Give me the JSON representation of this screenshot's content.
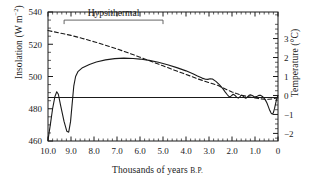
{
  "chart_data": {
    "type": "line",
    "title": "",
    "xlabel": "Thousands of years B.P.",
    "ylabel": "Insolation (W m−2)",
    "ylabel_right": "Temperature (°C)",
    "xlim": [
      10.0,
      0.0
    ],
    "ylim": [
      460,
      540
    ],
    "ylim_right": [
      -2.4,
      4.4
    ],
    "xticks": [
      "10.0",
      "9.0",
      "8.0",
      "7.0",
      "6.0",
      "5.0",
      "4.0",
      "3.0",
      "2.0",
      "1.0",
      "0"
    ],
    "xtick_values": [
      10.0,
      9.0,
      8.0,
      7.0,
      6.0,
      5.0,
      4.0,
      3.0,
      2.0,
      1.0,
      0.0
    ],
    "yticks_left": [
      "540",
      "520",
      "500",
      "480",
      "460"
    ],
    "ytick_values_left": [
      540,
      520,
      500,
      480,
      460
    ],
    "yticks_right": [
      "3",
      "2",
      "1",
      "0",
      "−1",
      "−2"
    ],
    "ytick_values_right": [
      3,
      2,
      1,
      0,
      -1,
      -2
    ],
    "grid": false,
    "minor_ticks": true,
    "legend_position": "none",
    "annotations": [
      {
        "name": "hypsithermal-label",
        "text": "Hypsithermal",
        "x_start": 9.3,
        "x_end": 5.0,
        "bracket_y_value": 535
      }
    ],
    "reference_line": {
      "name": "zero-temperature-line",
      "y_right_value": 0,
      "y_left_value": 487
    },
    "series": [
      {
        "name": "Insolation (dashed)",
        "style": "dashed",
        "axis": "left",
        "points": [
          [
            10.0,
            528.5
          ],
          [
            9.5,
            527.0
          ],
          [
            9.0,
            525.5
          ],
          [
            8.5,
            523.6
          ],
          [
            8.0,
            521.6
          ],
          [
            7.5,
            519.4
          ],
          [
            7.0,
            517.1
          ],
          [
            6.5,
            514.6
          ],
          [
            6.0,
            512.0
          ],
          [
            5.5,
            509.3
          ],
          [
            5.0,
            506.6
          ],
          [
            4.5,
            503.9
          ],
          [
            4.0,
            501.3
          ],
          [
            3.5,
            498.6
          ],
          [
            3.0,
            496.2
          ],
          [
            2.8,
            495.3
          ],
          [
            2.6,
            494.4
          ],
          [
            2.4,
            493.0
          ],
          [
            2.2,
            491.6
          ],
          [
            2.0,
            490.4
          ],
          [
            1.8,
            489.4
          ],
          [
            1.6,
            488.5
          ],
          [
            1.4,
            487.8
          ],
          [
            1.2,
            487.2
          ],
          [
            1.0,
            486.7
          ],
          [
            0.8,
            486.2
          ],
          [
            0.6,
            485.9
          ],
          [
            0.4,
            485.9
          ],
          [
            0.2,
            486.2
          ],
          [
            0.0,
            486.8
          ]
        ]
      },
      {
        "name": "Temperature (solid)",
        "style": "solid",
        "axis": "right",
        "points": [
          [
            10.0,
            460.5
          ],
          [
            9.9,
            470.0
          ],
          [
            9.8,
            480.0
          ],
          [
            9.7,
            487.5
          ],
          [
            9.62,
            490.5
          ],
          [
            9.55,
            489.0
          ],
          [
            9.45,
            482.0
          ],
          [
            9.3,
            472.0
          ],
          [
            9.18,
            466.0
          ],
          [
            9.1,
            465.5
          ],
          [
            9.02,
            472.0
          ],
          [
            8.95,
            483.0
          ],
          [
            8.88,
            494.0
          ],
          [
            8.8,
            500.0
          ],
          [
            8.7,
            503.0
          ],
          [
            8.5,
            505.5
          ],
          [
            8.2,
            507.5
          ],
          [
            7.9,
            509.0
          ],
          [
            7.5,
            510.3
          ],
          [
            7.1,
            511.1
          ],
          [
            6.7,
            511.4
          ],
          [
            6.3,
            511.2
          ],
          [
            6.0,
            510.8
          ],
          [
            5.6,
            510.0
          ],
          [
            5.2,
            508.8
          ],
          [
            4.8,
            507.3
          ],
          [
            4.4,
            505.5
          ],
          [
            4.0,
            503.5
          ],
          [
            3.7,
            501.7
          ],
          [
            3.5,
            500.3
          ],
          [
            3.3,
            499.0
          ],
          [
            3.15,
            498.3
          ],
          [
            3.05,
            498.2
          ],
          [
            2.95,
            498.6
          ],
          [
            2.85,
            498.4
          ],
          [
            2.7,
            497.0
          ],
          [
            2.55,
            495.0
          ],
          [
            2.4,
            492.5
          ],
          [
            2.3,
            490.5
          ],
          [
            2.22,
            489.0
          ],
          [
            2.15,
            487.8
          ],
          [
            2.1,
            487.3
          ],
          [
            2.03,
            488.0
          ],
          [
            1.95,
            489.0
          ],
          [
            1.88,
            488.4
          ],
          [
            1.8,
            487.2
          ],
          [
            1.73,
            486.6
          ],
          [
            1.66,
            487.4
          ],
          [
            1.6,
            488.4
          ],
          [
            1.53,
            488.0
          ],
          [
            1.46,
            486.9
          ],
          [
            1.4,
            486.5
          ],
          [
            1.33,
            487.3
          ],
          [
            1.26,
            488.3
          ],
          [
            1.2,
            488.6
          ],
          [
            1.12,
            488.2
          ],
          [
            1.05,
            487.6
          ],
          [
            0.98,
            487.4
          ],
          [
            0.9,
            487.8
          ],
          [
            0.82,
            488.3
          ],
          [
            0.75,
            488.3
          ],
          [
            0.68,
            487.6
          ],
          [
            0.6,
            486.5
          ],
          [
            0.54,
            485.2
          ],
          [
            0.48,
            483.6
          ],
          [
            0.42,
            481.3
          ],
          [
            0.36,
            479.0
          ],
          [
            0.3,
            477.3
          ],
          [
            0.25,
            476.6
          ],
          [
            0.2,
            477.6
          ],
          [
            0.15,
            480.2
          ],
          [
            0.1,
            483.5
          ],
          [
            0.05,
            486.5
          ],
          [
            0.0,
            488.2
          ]
        ]
      }
    ]
  }
}
